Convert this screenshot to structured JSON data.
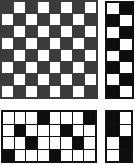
{
  "image": {
    "title": "Checkerboard pattern panels",
    "width": 135,
    "height": 165,
    "background_color": "#ffffff"
  },
  "colors": {
    "dark_gray": "#3b3b3b",
    "black": "#0d0d0d",
    "white": "#fefefe",
    "grid_line_gray": "#3b3b3b",
    "grid_line_black": "#111111"
  },
  "panels": [
    {
      "id": "top-left",
      "name": "large-gray-checkerboard",
      "columns": 8,
      "rows": 8,
      "dark_color": "#3b3b3b",
      "light_color": "#fefefe",
      "line_color": "#3b3b3b",
      "grid": [
        [
          1,
          0,
          1,
          0,
          1,
          0,
          1,
          0
        ],
        [
          0,
          1,
          0,
          1,
          0,
          1,
          0,
          1
        ],
        [
          1,
          0,
          1,
          0,
          1,
          0,
          1,
          0
        ],
        [
          0,
          1,
          0,
          1,
          0,
          1,
          0,
          1
        ],
        [
          1,
          0,
          1,
          0,
          1,
          0,
          1,
          0
        ],
        [
          0,
          1,
          0,
          1,
          0,
          1,
          0,
          1
        ],
        [
          1,
          0,
          1,
          0,
          1,
          0,
          1,
          0
        ],
        [
          0,
          1,
          0,
          1,
          0,
          1,
          0,
          1
        ]
      ]
    },
    {
      "id": "top-right",
      "name": "tall-black-checkerboard",
      "columns": 2,
      "rows": 8,
      "dark_color": "#0d0d0d",
      "light_color": "#fefefe",
      "line_color": "#111111",
      "grid": [
        [
          0,
          1
        ],
        [
          1,
          0
        ],
        [
          0,
          1
        ],
        [
          1,
          0
        ],
        [
          0,
          1
        ],
        [
          1,
          0
        ],
        [
          0,
          1
        ],
        [
          1,
          0
        ]
      ]
    },
    {
      "id": "bottom-left",
      "name": "wide-sparse-pattern",
      "columns": 8,
      "rows": 4,
      "dark_color": "#0d0d0d",
      "light_color": "#fefefe",
      "line_color": "#111111",
      "grid": [
        [
          0,
          0,
          0,
          1,
          0,
          0,
          0,
          1
        ],
        [
          0,
          1,
          0,
          0,
          0,
          1,
          0,
          0
        ],
        [
          0,
          0,
          1,
          0,
          0,
          0,
          1,
          0
        ],
        [
          1,
          0,
          0,
          0,
          1,
          0,
          0,
          0
        ]
      ]
    },
    {
      "id": "bottom-right",
      "name": "small-block-pattern",
      "columns": 2,
      "rows": 4,
      "dark_color": "#0d0d0d",
      "light_color": "#fefefe",
      "line_color": "#111111",
      "grid": [
        [
          1,
          0
        ],
        [
          1,
          0
        ],
        [
          0,
          1
        ],
        [
          0,
          1
        ]
      ]
    }
  ]
}
